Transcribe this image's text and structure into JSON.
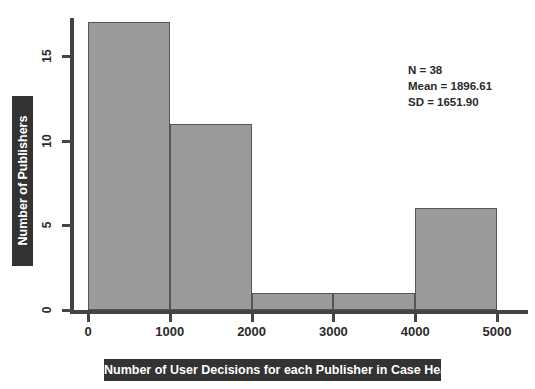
{
  "chart_data": {
    "type": "bar",
    "subtype": "histogram",
    "title": "",
    "xlabel": "Number of User Decisions for each Publisher in Case Heavy",
    "ylabel": "Number of Publishers",
    "bin_edges": [
      0,
      1000,
      2000,
      3000,
      4000,
      5000
    ],
    "categories": [
      "0-1000",
      "1000-2000",
      "2000-3000",
      "3000-4000",
      "4000-5000"
    ],
    "values": [
      17,
      11,
      1,
      1,
      6
    ],
    "bin_width": 1000,
    "xlim": [
      0,
      5000
    ],
    "ylim": [
      0,
      17.5
    ],
    "xticks": [
      0,
      1000,
      2000,
      3000,
      4000,
      5000
    ],
    "xtick_labels": [
      "0",
      "1000",
      "2000",
      "3000",
      "4000",
      "5000"
    ],
    "yticks": [
      0,
      5,
      10,
      15
    ],
    "ytick_labels": [
      "0",
      "5",
      "10",
      "15"
    ],
    "grid": false,
    "legend": false,
    "bar_fill_color": "#9b9b9b",
    "bar_edge_color": "#555555",
    "axis_color": "#444444",
    "label_box_color": "#333333",
    "label_text_color": "#ffffff",
    "background_color": "#ffffff"
  },
  "annotation": {
    "n_label": "N = 38",
    "mean_label": "Mean = 1896.61",
    "sd_label": "SD = 1651.90",
    "n_value": 38,
    "mean_value": 1896.61,
    "sd_value": 1651.9
  }
}
